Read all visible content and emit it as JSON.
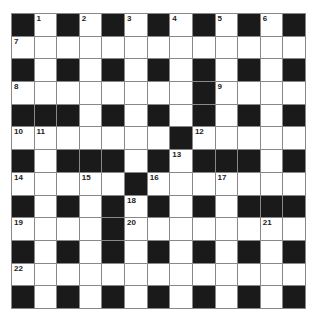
{
  "puzzle": {
    "rows": 13,
    "cols": 13,
    "grid": [
      "#.#.#.#.#.#.#",
      ".............",
      "#.#.#.#.#.#.#",
      "........#....",
      "###.#.#.#.#.#",
      ".......#.....",
      "#.###.#.###.#",
      ".....#.......",
      "#.#.#.#.#.###",
      "....#........",
      "#.#.#.#.#.#.#",
      ".............",
      "#.#.#.#.#.#.#"
    ],
    "numbers": [
      {
        "r": 0,
        "c": 1,
        "n": "1"
      },
      {
        "r": 0,
        "c": 3,
        "n": "2"
      },
      {
        "r": 0,
        "c": 5,
        "n": "3"
      },
      {
        "r": 0,
        "c": 7,
        "n": "4"
      },
      {
        "r": 0,
        "c": 9,
        "n": "5"
      },
      {
        "r": 0,
        "c": 11,
        "n": "6"
      },
      {
        "r": 1,
        "c": 0,
        "n": "7"
      },
      {
        "r": 3,
        "c": 0,
        "n": "8"
      },
      {
        "r": 3,
        "c": 9,
        "n": "9"
      },
      {
        "r": 5,
        "c": 0,
        "n": "10"
      },
      {
        "r": 5,
        "c": 1,
        "n": "11"
      },
      {
        "r": 5,
        "c": 8,
        "n": "12"
      },
      {
        "r": 6,
        "c": 7,
        "n": "13"
      },
      {
        "r": 7,
        "c": 0,
        "n": "14"
      },
      {
        "r": 7,
        "c": 3,
        "n": "15"
      },
      {
        "r": 7,
        "c": 6,
        "n": "16"
      },
      {
        "r": 7,
        "c": 9,
        "n": "17"
      },
      {
        "r": 8,
        "c": 5,
        "n": "18"
      },
      {
        "r": 9,
        "c": 0,
        "n": "19"
      },
      {
        "r": 9,
        "c": 5,
        "n": "20"
      },
      {
        "r": 9,
        "c": 11,
        "n": "21"
      },
      {
        "r": 11,
        "c": 0,
        "n": "22"
      }
    ]
  },
  "colors": {
    "black_cell": "#1a1a1a",
    "white_cell": "#ffffff",
    "grid_line": "#888888"
  }
}
